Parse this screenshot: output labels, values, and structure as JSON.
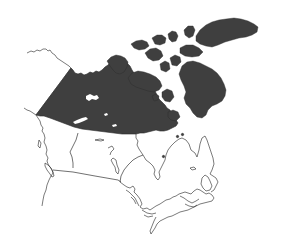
{
  "map": {
    "subject": "Canada",
    "style": "black-and-white outline map",
    "highlighted_region": "Northern territories (Northwest Territories incl. Arctic Archipelago)",
    "highlight_color": "#3f3f3f",
    "background_color": "#ffffff",
    "outline_color": "#222222",
    "labels": []
  }
}
